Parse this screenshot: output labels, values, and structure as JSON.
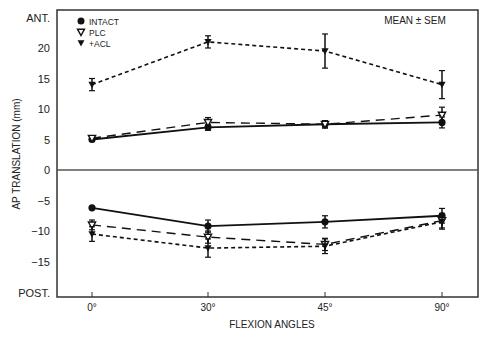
{
  "chart_data": {
    "type": "line",
    "title": "",
    "annotation": "MEAN ± SEM",
    "xlabel": "FLEXION ANGLES",
    "ylabel": "AP TRANSLATION (mm)",
    "categories": [
      "0°",
      "30°",
      "45°",
      "90°"
    ],
    "y_tick_labels": [
      "ANT.",
      "20",
      "15",
      "10",
      "5",
      "0",
      "-5",
      "-10",
      "-15",
      "POST."
    ],
    "y_ticks": [
      20,
      15,
      10,
      5,
      0,
      -5,
      -10,
      -15
    ],
    "y_top_label": "ANT.",
    "y_bottom_label": "POST.",
    "ylim": [
      -19,
      23
    ],
    "grid": false,
    "zero_line": true,
    "legend_position": "upper-left",
    "legend": [
      {
        "name": "INTACT",
        "marker": "filled-circle",
        "line": "solid"
      },
      {
        "name": "PLC",
        "marker": "open-down-triangle",
        "line": "long-dash"
      },
      {
        "name": "+ACL",
        "marker": "filled-down-triangle",
        "line": "short-dash"
      }
    ],
    "panels": [
      {
        "name": "anterior",
        "series": [
          {
            "name": "INTACT",
            "values": [
              5.0,
              7.0,
              7.5,
              7.8
            ],
            "sem": [
              0.3,
              0.5,
              0.6,
              0.9
            ]
          },
          {
            "name": "PLC",
            "values": [
              5.2,
              7.8,
              7.5,
              9.0
            ],
            "sem": [
              0.3,
              0.8,
              0.6,
              1.3
            ]
          },
          {
            "name": "+ACL",
            "values": [
              14.0,
              21.0,
              19.5,
              14.0
            ],
            "sem": [
              1.0,
              1.0,
              2.8,
              2.3
            ]
          }
        ]
      },
      {
        "name": "posterior",
        "series": [
          {
            "name": "INTACT",
            "values": [
              -6.2,
              -9.2,
              -8.5,
              -7.5
            ],
            "sem": [
              0.2,
              1.0,
              1.0,
              1.2
            ]
          },
          {
            "name": "PLC",
            "values": [
              -9.0,
              -11.0,
              -12.2,
              -8.3
            ],
            "sem": [
              0.8,
              1.0,
              1.0,
              1.2
            ]
          },
          {
            "name": "+ACL",
            "values": [
              -10.5,
              -12.8,
              -12.5,
              -8.5
            ],
            "sem": [
              1.2,
              1.5,
              1.2,
              1.2
            ]
          }
        ]
      }
    ]
  }
}
